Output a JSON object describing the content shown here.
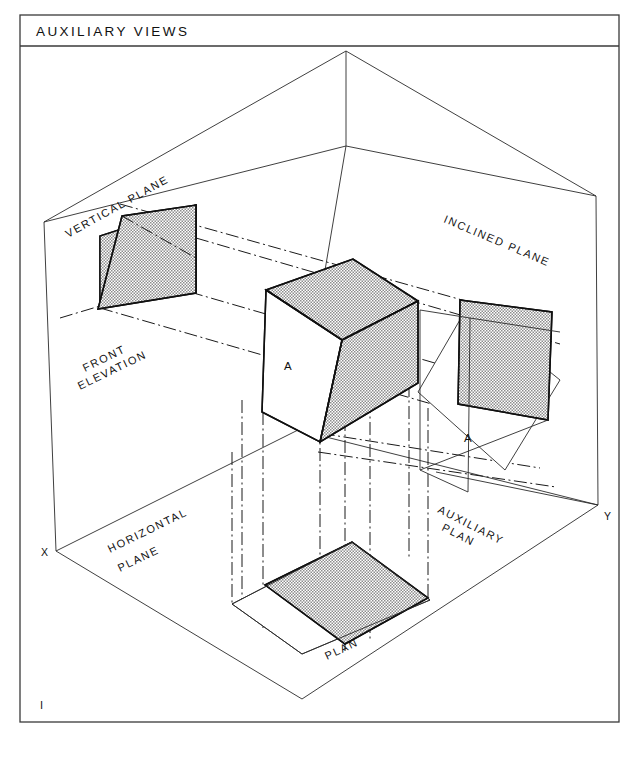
{
  "sheet": {
    "title": "AUXILIARY VIEWS",
    "sheet_mark": "I",
    "background_color": "#ffffff",
    "line_color": "#101010",
    "shade_color": "#c9c9c9",
    "frame": {
      "x": 20,
      "y": 15,
      "width": 599,
      "height": 707,
      "title_band_height": 31
    }
  },
  "labels": {
    "vertical_plane": "VERTICAL PLANE",
    "inclined_plane": "INCLINED PLANE",
    "horizontal_plane_line1": "HORIZONTAL",
    "horizontal_plane_line2": "PLANE",
    "front_elevation_line1": "FRONT",
    "front_elevation_line2": "ELEVATION",
    "auxiliary_plan_line1": "AUXILIARY",
    "auxiliary_plan_line2": "PLAN",
    "plan": "PLAN",
    "face_front_elevation": "A",
    "face_auxiliary_plan": "A",
    "corner_x": "X",
    "corner_y": "Y"
  },
  "views": [
    {
      "name": "front-elevation",
      "label": "FRONT ELEVATION",
      "face_letter": "A",
      "shaded": true
    },
    {
      "name": "inclined-plane",
      "label": "INCLINED PLANE",
      "shaded": false
    },
    {
      "name": "vertical-plane",
      "label": "VERTICAL PLANE",
      "shaded": true
    },
    {
      "name": "horizontal-plane",
      "label": "HORIZONTAL PLANE",
      "shaded": false
    },
    {
      "name": "auxiliary-plan",
      "label": "AUXILIARY PLAN",
      "face_letter": "A",
      "shaded": true
    },
    {
      "name": "plan",
      "label": "PLAN",
      "shaded": true
    }
  ]
}
